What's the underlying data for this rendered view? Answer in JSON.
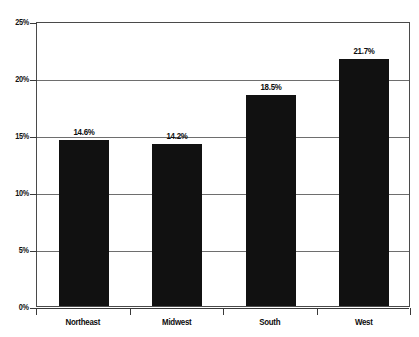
{
  "chart_data": {
    "type": "bar",
    "title": "",
    "subtitle": "",
    "xlabel": "",
    "ylabel": "",
    "categories": [
      "Northeast",
      "Midwest",
      "South",
      "West"
    ],
    "values": [
      14.6,
      14.2,
      18.5,
      21.7
    ],
    "value_labels": [
      "14.6%",
      "14.2%",
      "18.5%",
      "21.7%"
    ],
    "ylim": [
      0,
      25
    ],
    "ytick_values": [
      0,
      5,
      10,
      15,
      20,
      25
    ],
    "ytick_labels": [
      "0%",
      "5%",
      "10%",
      "15%",
      "20%",
      "25%"
    ],
    "grid": true,
    "legend": false,
    "bar_color": "#111111",
    "grid_color": "#6e6e6e",
    "axis_color": "#3a3a3a",
    "text_color": "#0d0d0d",
    "background_color": "#ffffff"
  }
}
